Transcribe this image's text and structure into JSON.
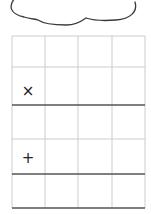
{
  "cloud": {
    "stroke_color": "#3a3a3a"
  },
  "grid": {
    "columns": 4,
    "rows": 5,
    "col_x": [
      12,
      45,
      78,
      112,
      145
    ],
    "row_lines": [
      {
        "y": 36,
        "style": "light"
      },
      {
        "y": 67,
        "style": "light"
      },
      {
        "y": 105,
        "style": "dark"
      },
      {
        "y": 139,
        "style": "light"
      },
      {
        "y": 174,
        "style": "dark"
      },
      {
        "y": 208,
        "style": "dark"
      }
    ],
    "light_color": "#cccccc",
    "dark_color": "#555555"
  },
  "marks": [
    {
      "symbol": "×",
      "row": 2,
      "col": 1,
      "name": "cross-mark"
    },
    {
      "symbol": "+",
      "row": 4,
      "col": 1,
      "name": "plus-mark"
    }
  ]
}
